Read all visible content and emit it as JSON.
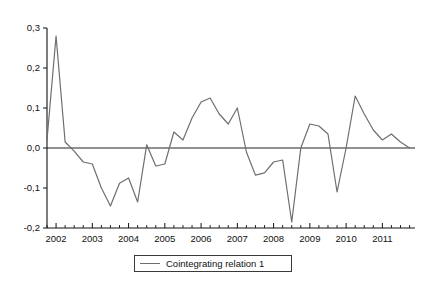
{
  "chart_data": {
    "type": "line",
    "title": "",
    "xlabel": "",
    "ylabel": "",
    "xlim": [
      2001.75,
      2011.9
    ],
    "ylim": [
      -0.2,
      0.3
    ],
    "grid": false,
    "zero_reference_line": 0.0,
    "legend_position": "bottom-center",
    "y_tick_labels": [
      "0,3",
      "0,2",
      "0,1",
      "0,0",
      "-0,1",
      "-0,2"
    ],
    "y_tick_values": [
      0.3,
      0.2,
      0.1,
      0.0,
      -0.1,
      -0.2
    ],
    "x_tick_labels": [
      "2002",
      "2003",
      "2004",
      "2005",
      "2006",
      "2007",
      "2008",
      "2009",
      "2010",
      "2011"
    ],
    "x_tick_values": [
      2002,
      2003,
      2004,
      2005,
      2006,
      2007,
      2008,
      2009,
      2010,
      2011
    ],
    "x_minor_ticks_per_interval": 4,
    "series": [
      {
        "name": "Cointegrating relation 1",
        "color": "#6e6e6e",
        "x": [
          2001.75,
          2002.0,
          2002.25,
          2002.5,
          2002.75,
          2003.0,
          2003.25,
          2003.5,
          2003.75,
          2004.0,
          2004.25,
          2004.5,
          2004.75,
          2005.0,
          2005.25,
          2005.5,
          2005.75,
          2006.0,
          2006.25,
          2006.5,
          2006.75,
          2007.0,
          2007.25,
          2007.5,
          2007.75,
          2008.0,
          2008.25,
          2008.5,
          2008.75,
          2009.0,
          2009.25,
          2009.5,
          2009.75,
          2010.0,
          2010.25,
          2010.5,
          2010.75,
          2011.0,
          2011.25,
          2011.5,
          2011.75
        ],
        "values": [
          0.02,
          0.28,
          0.015,
          -0.008,
          -0.035,
          -0.04,
          -0.1,
          -0.145,
          -0.088,
          -0.075,
          -0.135,
          0.008,
          -0.045,
          -0.04,
          0.04,
          0.02,
          0.075,
          0.115,
          0.125,
          0.085,
          0.06,
          0.1,
          -0.01,
          -0.068,
          -0.062,
          -0.035,
          -0.03,
          -0.185,
          0.0,
          0.06,
          0.055,
          0.035,
          -0.11,
          0.0,
          0.13,
          0.085,
          0.045,
          0.02,
          0.035,
          0.015,
          0.0
        ]
      }
    ]
  },
  "legend": {
    "entries": [
      {
        "label": "Cointegrating relation 1",
        "color": "#6e6e6e"
      }
    ]
  }
}
